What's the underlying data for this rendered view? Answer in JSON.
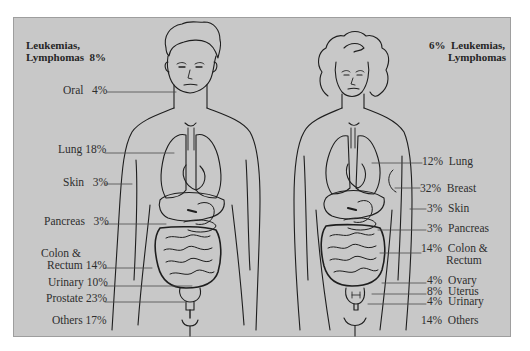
{
  "figure": {
    "background_color": "#c8c8c8",
    "line_color": "#1e1e1e",
    "text_color": "#2e2e2e"
  },
  "male": {
    "name": "Male cancer incidence by site",
    "leukemia": {
      "label_line1": "Leukemias,",
      "label_line2": "Lymphomas",
      "percent": "8%"
    },
    "sites": [
      {
        "site": "Oral",
        "percent": "4%"
      },
      {
        "site": "Lung",
        "percent": "18%"
      },
      {
        "site": "Skin",
        "percent": "3%"
      },
      {
        "site": "Pancreas",
        "percent": "3%"
      },
      {
        "site_line1": "Colon &",
        "site": "Rectum",
        "percent": "14%"
      },
      {
        "site": "Urinary",
        "percent": "10%"
      },
      {
        "site": "Prostate",
        "percent": "23%"
      },
      {
        "site": "Others",
        "percent": "17%"
      }
    ]
  },
  "female": {
    "name": "Female cancer incidence by site",
    "leukemia": {
      "label_line1": "Leukemias,",
      "label_line2": "Lymphomas",
      "percent": "6%"
    },
    "sites": [
      {
        "site": "Lung",
        "percent": "12%"
      },
      {
        "site": "Breast",
        "percent": "32%"
      },
      {
        "site": "Skin",
        "percent": "3%"
      },
      {
        "site": "Pancreas",
        "percent": "3%"
      },
      {
        "site_line1": "Colon &",
        "site": "Rectum",
        "percent": "14%"
      },
      {
        "site": "Ovary",
        "percent": "4%"
      },
      {
        "site": "Uterus",
        "percent": "8%"
      },
      {
        "site": "Urinary",
        "percent": "4%"
      },
      {
        "site": "Others",
        "percent": "14%"
      }
    ]
  }
}
